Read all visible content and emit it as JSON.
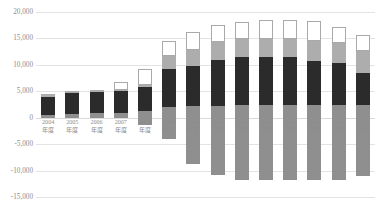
{
  "chart_data": {
    "type": "bar",
    "stacked": true,
    "title": "",
    "subtitle": "",
    "xlabel": "",
    "ylabel": "",
    "ylim": [
      -15000,
      20000
    ],
    "ytick_step": 5000,
    "grid": true,
    "legend_position": "none",
    "ytick_labels": [
      "20,000",
      "15,000",
      "10,000",
      "5,000",
      "0",
      "-5,000",
      "-10,000",
      "-15,000"
    ],
    "ytick_values": [
      20000,
      15000,
      10000,
      5000,
      0,
      -5000,
      -10000,
      -15000
    ],
    "categories": [
      "2004\n年度",
      "2005\n年度",
      "2006\n年度",
      "2007\n年度",
      "2008\n年度",
      "2009\n年度",
      "2010\n年度",
      "2011\n年度",
      "2012\n年度",
      "2013\n年度",
      "2014\n年度",
      "2015\n年度",
      "2016\n年度",
      "2017\n年度"
    ],
    "category_lines": [
      [
        "2004",
        "年度"
      ],
      [
        "2005",
        "年度"
      ],
      [
        "2006",
        "年度"
      ],
      [
        "2007",
        "年度"
      ],
      [
        "2008",
        "年度"
      ],
      [
        "2009",
        "年度"
      ],
      [
        "2010",
        "年度"
      ],
      [
        "2011",
        "年度"
      ],
      [
        "2012",
        "年度"
      ],
      [
        "2013",
        "年度"
      ],
      [
        "2014",
        "年度"
      ],
      [
        "2015",
        "年度"
      ],
      [
        "2016",
        "年度"
      ],
      [
        "2017",
        "年度"
      ]
    ],
    "series": [
      {
        "name": "base-gray",
        "color": "#8f8f8f",
        "values": [
          600,
          700,
          800,
          900,
          1200,
          2000,
          2200,
          2300,
          2400,
          2400,
          2400,
          2400,
          2400,
          2400
        ]
      },
      {
        "name": "dark",
        "color": "#2b2b2b",
        "values": [
          3400,
          3900,
          4100,
          4100,
          4700,
          7300,
          7600,
          8600,
          9000,
          9000,
          9000,
          8300,
          8000,
          6000
        ]
      },
      {
        "name": "light-gray",
        "color": "#adadad",
        "values": [
          400,
          400,
          400,
          200,
          200,
          2300,
          3100,
          3400,
          3500,
          3400,
          3400,
          3800,
          3800,
          4300
        ]
      },
      {
        "name": "white-top",
        "color": "#ffffff",
        "values": [
          0,
          0,
          0,
          1500,
          3100,
          3000,
          3400,
          3200,
          3200,
          3600,
          3600,
          3800,
          3000,
          3000
        ]
      }
    ],
    "negative_base": {
      "name": "below-zero-gray",
      "color": "#8f8f8f",
      "values": [
        0,
        0,
        0,
        0,
        -1400,
        -4100,
        -8700,
        -10900,
        -11700,
        -11700,
        -11700,
        -11700,
        -11700,
        -11100
      ]
    }
  }
}
